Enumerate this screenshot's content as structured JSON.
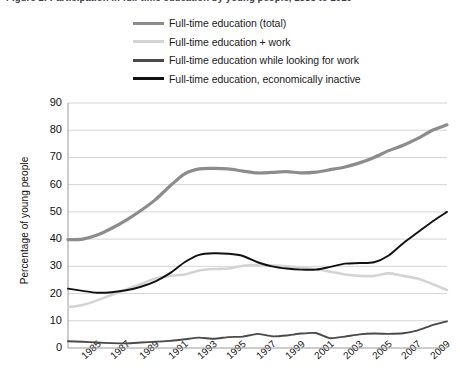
{
  "title": {
    "text": "Figure 1: Participation in full-time education by young people, 1985 to 2010"
  },
  "axis": {
    "ylabel": "Percentage of young people",
    "yticks": [
      "90",
      "80",
      "70",
      "60",
      "50",
      "40",
      "30",
      "20",
      "10",
      "0"
    ],
    "xticks": [
      "1985",
      "1987",
      "1989",
      "1991",
      "1993",
      "1995",
      "1997",
      "1999",
      "2001",
      "2003",
      "2005",
      "2007",
      "2009"
    ]
  },
  "legend": {
    "items": [
      {
        "label": "Full-time education (total)",
        "color": "#8c8c8c"
      },
      {
        "label": "Full-time education + work",
        "color": "#d4d4d4"
      },
      {
        "label": "Full-time education while looking for work",
        "color": "#4a4a4a"
      },
      {
        "label": "Full-time education, economically inactive",
        "color": "#111111"
      }
    ]
  },
  "chart_data": {
    "type": "line",
    "title": "Figure 1: Participation in full-time education by young people, 1985 to 2010",
    "xlabel": "",
    "ylabel": "Percentage of young people",
    "xlim": [
      1984,
      2010
    ],
    "ylim": [
      0,
      90
    ],
    "ytick_step": 10,
    "grid": "horizontal",
    "legend_position": "top",
    "x": [
      1984,
      1985,
      1986,
      1987,
      1988,
      1989,
      1990,
      1991,
      1992,
      1993,
      1994,
      1995,
      1996,
      1997,
      1998,
      1999,
      2000,
      2001,
      2002,
      2003,
      2004,
      2005,
      2006,
      2007,
      2008,
      2009,
      2010
    ],
    "series": [
      {
        "name": "Full-time education (total)",
        "color": "#8c8c8c",
        "width": 3.2,
        "values": [
          39.8,
          40.0,
          41.5,
          44.0,
          47.0,
          50.5,
          54.5,
          59.5,
          64.0,
          65.8,
          66.0,
          65.8,
          65.0,
          64.3,
          64.5,
          64.8,
          64.3,
          64.6,
          65.5,
          66.5,
          68.0,
          70.0,
          72.5,
          74.5,
          77.0,
          80.0,
          82.0
        ]
      },
      {
        "name": "Full-time education + work",
        "color": "#d4d4d4",
        "width": 2.6,
        "values": [
          15.0,
          15.8,
          17.5,
          19.5,
          21.5,
          23.5,
          25.5,
          26.5,
          27.0,
          28.5,
          29.0,
          29.2,
          30.2,
          30.5,
          30.3,
          30.0,
          29.5,
          29.0,
          28.0,
          27.0,
          26.5,
          26.5,
          27.5,
          26.5,
          25.5,
          23.5,
          21.3
        ]
      },
      {
        "name": "Full-time education while looking for work",
        "color": "#4a4a4a",
        "width": 1.9,
        "values": [
          2.5,
          2.3,
          2.0,
          1.8,
          1.7,
          2.0,
          2.3,
          2.6,
          3.2,
          3.8,
          3.4,
          4.0,
          4.2,
          5.2,
          4.3,
          4.6,
          5.3,
          5.5,
          3.6,
          4.2,
          5.0,
          5.3,
          5.2,
          5.4,
          6.5,
          8.4,
          9.8
        ]
      },
      {
        "name": "Full-time education, economically inactive",
        "color": "#111111",
        "width": 1.9,
        "values": [
          21.8,
          21.0,
          20.3,
          20.5,
          21.2,
          22.5,
          24.5,
          27.5,
          31.5,
          34.2,
          34.8,
          34.6,
          33.8,
          31.5,
          30.0,
          29.2,
          28.8,
          28.8,
          29.8,
          31.0,
          31.2,
          31.5,
          34.0,
          38.5,
          42.5,
          46.5,
          50.0
        ]
      }
    ]
  }
}
